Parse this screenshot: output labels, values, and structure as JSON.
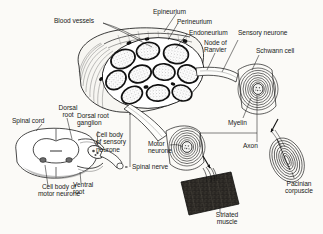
{
  "figure": {
    "background_color": "#fbfaf7",
    "ink_color": "#1a1a1a"
  },
  "labels": {
    "blood_vessels": "Blood vessels",
    "epineurium": "Epineurium",
    "perineurium": "Perineurium",
    "endoneurium": "Endoneurium",
    "node_of_ranvier": "Node of\nRanvier",
    "sensory_neurone": "Sensory neurone",
    "schwann_cell": "Schwann cell",
    "myelin": "Myelin",
    "axon": "Axon",
    "pacinian_corpuscle": "Pacinian\ncorpuscle",
    "striated_muscle": "Striated\nmuscle",
    "motor_neurone": "Motor\nneurone",
    "spinal_nerve": "Spinal nerve",
    "spinal_cord": "Spinal cord",
    "dorsal_root": "Dorsal\nroot",
    "dorsal_root_ganglion": "Dorsal root\nganglion",
    "cell_body_of_sensory_neurone": "Cell body\nof sensory\nneurone",
    "ventral_root": "Ventral\nroot",
    "cell_body_of_motor_neurone": "Cell body of\nmotor neurone"
  },
  "structures": {
    "nerve_trunk": {
      "name": "nerve-trunk-cross-section",
      "fascicle_count": 10,
      "blood_vessel_count": 7
    },
    "myelinated_fibre_sensory": {
      "name": "sensory-myelinated-fibre",
      "myelin_wraps": 9
    },
    "myelinated_fibre_motor": {
      "name": "motor-myelinated-fibre",
      "myelin_wraps": 8
    },
    "pacinian_corpuscle": {
      "name": "pacinian-corpuscle",
      "lamellae": 9
    },
    "spinal_cord": {
      "name": "spinal-cord-cross-section"
    },
    "striated_muscle": {
      "name": "striated-muscle-block"
    }
  }
}
